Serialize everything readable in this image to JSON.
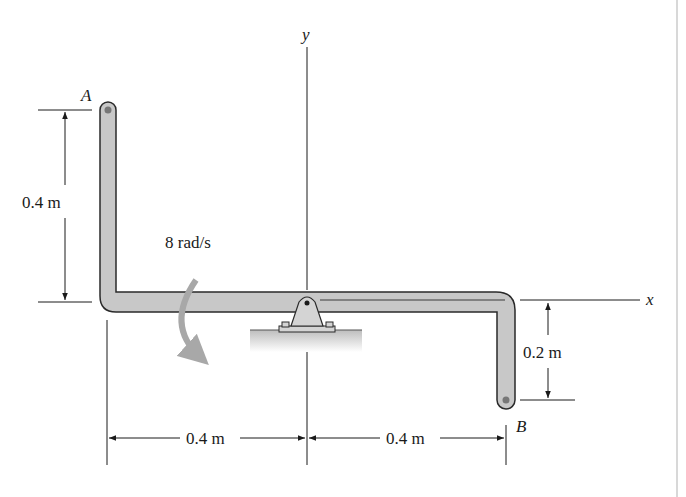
{
  "figure": {
    "type": "rigid-body rotation diagram",
    "points": {
      "A": "A",
      "B": "B"
    },
    "axes": {
      "x": "x",
      "y": "y"
    },
    "angular_velocity": "8 rad/s",
    "dimensions": {
      "vertical_A": "0.4 m",
      "vertical_B": "0.2 m",
      "horizontal_left": "0.4 m",
      "horizontal_right": "0.4 m"
    },
    "colors": {
      "rod_fill": "#c8c8c8",
      "rod_outline": "#2a2a2a",
      "arrow_gray": "#a8a8a8",
      "line": "#1a1a1a",
      "frame_edge": "#d8d8d8"
    }
  }
}
